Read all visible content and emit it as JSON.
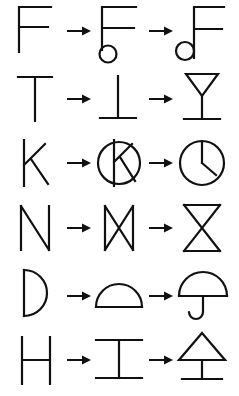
{
  "canvas": {
    "width": 239,
    "height": 396,
    "background_color": "#ffffff",
    "ink_color": "#111111"
  },
  "illustration": {
    "title": "Letter-to-picture drawing transformations",
    "description": "Six rows, each showing a capital letter transformed in two steps into a picture of an object.",
    "arrow_glyph": "arrow-right",
    "rows": [
      {
        "index": 1,
        "letter": "F",
        "steps": [
          {
            "stage": "letter",
            "name": "letter-f",
            "label": "F"
          },
          {
            "stage": "rotated",
            "name": "f-with-circle",
            "label": "F rotated with circle"
          },
          {
            "stage": "picture",
            "name": "eighth-note",
            "label": "Eighth note"
          }
        ]
      },
      {
        "index": 2,
        "letter": "T",
        "steps": [
          {
            "stage": "letter",
            "name": "letter-t",
            "label": "T"
          },
          {
            "stage": "rotated",
            "name": "t-upside-down",
            "label": "Upside-down T"
          },
          {
            "stage": "picture",
            "name": "wine-glass",
            "label": "Wine glass"
          }
        ]
      },
      {
        "index": 3,
        "letter": "K",
        "steps": [
          {
            "stage": "letter",
            "name": "letter-k",
            "label": "K"
          },
          {
            "stage": "rotated",
            "name": "k-in-circle",
            "label": "K inside circle"
          },
          {
            "stage": "picture",
            "name": "clock",
            "label": "Clock"
          }
        ]
      },
      {
        "index": 4,
        "letter": "N",
        "steps": [
          {
            "stage": "letter",
            "name": "letter-n",
            "label": "N"
          },
          {
            "stage": "rotated",
            "name": "n-bowtie",
            "label": "N turned into bowtie"
          },
          {
            "stage": "picture",
            "name": "hourglass",
            "label": "Hourglass"
          }
        ]
      },
      {
        "index": 5,
        "letter": "D",
        "steps": [
          {
            "stage": "letter",
            "name": "letter-d",
            "label": "D"
          },
          {
            "stage": "rotated",
            "name": "d-dome",
            "label": "D rotated into dome"
          },
          {
            "stage": "picture",
            "name": "umbrella",
            "label": "Umbrella"
          }
        ]
      },
      {
        "index": 6,
        "letter": "H",
        "steps": [
          {
            "stage": "letter",
            "name": "letter-h",
            "label": "H"
          },
          {
            "stage": "rotated",
            "name": "h-ibeam",
            "label": "H rotated into I-beam"
          },
          {
            "stage": "picture",
            "name": "tree",
            "label": "Tree"
          }
        ]
      }
    ]
  }
}
